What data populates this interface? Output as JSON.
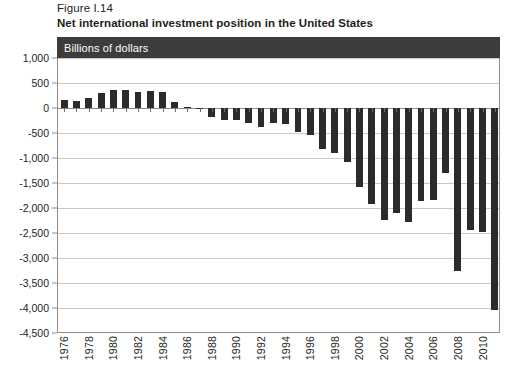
{
  "figure": {
    "number": "Figure I.14",
    "title": "Net international investment position in the United States",
    "unit_banner": "Billions of dollars",
    "banner_color": "#3c3c3c",
    "bar_color": "#2b2b2b"
  },
  "chart_data": {
    "type": "bar",
    "title": "Net international investment position in the United States",
    "subtitle": "Figure I.14",
    "xlabel": "",
    "ylabel": "Billions of dollars",
    "ylim": [
      -4500,
      1000
    ],
    "ytick_step": 500,
    "grid": true,
    "legend": null,
    "ytick_labels": [
      "1,000",
      "500",
      "0",
      "-500",
      "-1,000",
      "-1,500",
      "-2,000",
      "-2,500",
      "-3,000",
      "-3,500",
      "-4,000",
      "-4,500"
    ],
    "ytick_values": [
      1000,
      500,
      0,
      -500,
      -1000,
      -1500,
      -2000,
      -2500,
      -3000,
      -3500,
      -4000,
      -4500
    ],
    "xtick_labels": [
      "1976",
      "1978",
      "1980",
      "1982",
      "1984",
      "1986",
      "1988",
      "1990",
      "1992",
      "1994",
      "1996",
      "1998",
      "2000",
      "2002",
      "2004",
      "2006",
      "2008",
      "2010"
    ],
    "categories": [
      "1976",
      "1977",
      "1978",
      "1979",
      "1980",
      "1981",
      "1982",
      "1983",
      "1984",
      "1985",
      "1986",
      "1987",
      "1988",
      "1989",
      "1990",
      "1991",
      "1992",
      "1993",
      "1994",
      "1995",
      "1996",
      "1997",
      "1998",
      "1999",
      "2000",
      "2001",
      "2002",
      "2003",
      "2004",
      "2005",
      "2006",
      "2007",
      "2008",
      "2009",
      "2010",
      "2011"
    ],
    "values": [
      160,
      150,
      210,
      310,
      360,
      370,
      330,
      340,
      320,
      130,
      20,
      -20,
      -180,
      -240,
      -240,
      -300,
      -380,
      -300,
      -320,
      -480,
      -540,
      -820,
      -900,
      -1070,
      -1580,
      -1920,
      -2240,
      -2090,
      -2280,
      -1850,
      -1840,
      -1300,
      -3260,
      -2440,
      -2470,
      -4030
    ]
  }
}
